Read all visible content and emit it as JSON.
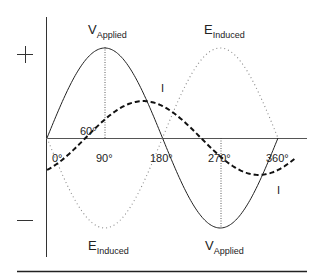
{
  "diagram": {
    "title": "",
    "polarity": {
      "positive": "+",
      "negative": "—"
    },
    "labels": {
      "v_applied_top": {
        "main": "V",
        "sub": "Applied"
      },
      "v_applied_bottom": {
        "main": "V",
        "sub": "Applied"
      },
      "e_induced_top": {
        "main": "E",
        "sub": "Induced"
      },
      "e_induced_bottom": {
        "main": "E",
        "sub": "Induced"
      },
      "current_top": "I",
      "current_bottom": "I",
      "phase_angle": "60°"
    },
    "x_ticks": [
      "0°",
      "90°",
      "180°",
      "270°",
      "360°"
    ],
    "colors": {
      "lines": "#222222",
      "dotted": "#888888",
      "background": "#ffffff"
    }
  },
  "chart_data": {
    "type": "line",
    "title": "",
    "xlabel": "Phase angle (degrees)",
    "ylabel": "",
    "x_ticks": [
      0,
      90,
      180,
      270,
      360
    ],
    "series": [
      {
        "name": "V Applied",
        "style": "solid",
        "function": "sin(θ)",
        "amplitude": 1.0,
        "phase_deg": 0
      },
      {
        "name": "E Induced",
        "style": "dotted",
        "function": "-sin(θ)",
        "amplitude": 1.0,
        "phase_deg": 180
      },
      {
        "name": "I",
        "style": "dashed",
        "function": "sin(θ-60°)",
        "amplitude": 0.41,
        "phase_deg": -60
      }
    ],
    "annotations": [
      "60° lag of current",
      "+ / − polarity markers"
    ]
  }
}
